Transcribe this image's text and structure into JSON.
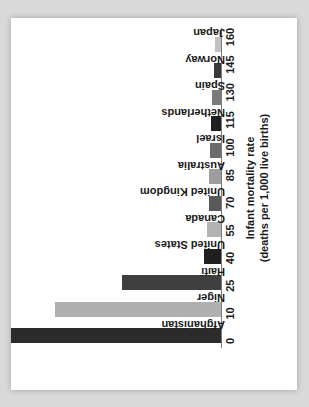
{
  "chart_data": {
    "type": "bar",
    "title": "",
    "subtitle": "",
    "orientation": "vertical-rotated",
    "xlabel": "",
    "ylabel": "Infant mortality rate",
    "ylabel_line2": "(deaths per 1,000 live births)",
    "categories": [
      "Afghanistan",
      "Niger",
      "Haiti",
      "United States",
      "Canada",
      "United Kingdom",
      "Australia",
      "Israel",
      "Netherlands",
      "Spain",
      "Norway",
      "Japan"
    ],
    "values": [
      117,
      85,
      49,
      6,
      5,
      4.4,
      4.4,
      3.9,
      3.7,
      3.3,
      2.5,
      2.2
    ],
    "tick_labels": [
      "0",
      "10",
      "25",
      "40",
      "55",
      "70",
      "85",
      "100",
      "115",
      "130",
      "145",
      "160"
    ],
    "tick_values": [
      0,
      10,
      25,
      40,
      55,
      70,
      85,
      100,
      115,
      130,
      145,
      160
    ],
    "ylim": [
      0,
      160
    ],
    "grid": false,
    "legend": false,
    "bar_colors": [
      "#2b2b2b",
      "#b0b0b0",
      "#3f3f3f",
      "#1f1f1f",
      "#b3b3b3",
      "#595959",
      "#9d9d9d",
      "#6b6b6b",
      "#1f1f1f",
      "#7a7a7a",
      "#3a3a3a",
      "#c0c0c0"
    ]
  }
}
